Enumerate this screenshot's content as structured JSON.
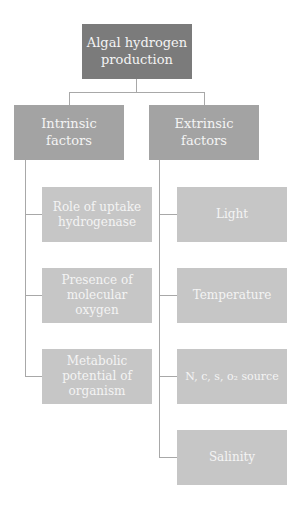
{
  "diagram": {
    "type": "hierarchy",
    "root": {
      "label": "Algal hydrogen production"
    },
    "branches": [
      {
        "label": "Intrinsic factors",
        "children": [
          {
            "label": "Role of uptake hydrogenase"
          },
          {
            "label": "Presence of molecular oxygen"
          },
          {
            "label": "Metabolic potential of organism"
          }
        ]
      },
      {
        "label": "Extrinsic factors",
        "children": [
          {
            "label": "Light"
          },
          {
            "label": "Temperature"
          },
          {
            "label": "N, c, s, o₂ source"
          },
          {
            "label": "Salinity"
          }
        ]
      }
    ],
    "colors": {
      "root": "#7b7b7b",
      "branch": "#a3a3a3",
      "leaf": "#c6c6c6",
      "connector": "#a8a8a8",
      "text": "#f4f4f4"
    }
  }
}
